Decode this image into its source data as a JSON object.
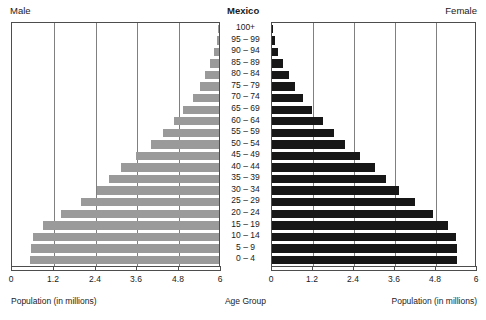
{
  "header": {
    "left_label": "Male",
    "title": "Mexico",
    "right_label": "Female"
  },
  "axis": {
    "left_title": "Population (in millions)",
    "center_title": "Age Group",
    "right_title": "Population (in millions)",
    "left_ticks": [
      "6",
      "4.8",
      "3.6",
      "2.4",
      "1.2",
      "0"
    ],
    "right_ticks": [
      "0",
      "1.2",
      "2.4",
      "3.6",
      "4.8",
      "6"
    ]
  },
  "chart_data": {
    "type": "bar",
    "subtype": "population-pyramid",
    "title": "Mexico",
    "xlabel": "Population (in millions)",
    "ylabel": "Age Group",
    "xlim": [
      0,
      6
    ],
    "xticks": [
      0,
      1.2,
      2.4,
      3.6,
      4.8,
      6
    ],
    "grid": true,
    "legend_position": "top",
    "categories": [
      "100+",
      "95 – 99",
      "90 – 94",
      "85 – 89",
      "80 – 84",
      "75 – 79",
      "70 – 74",
      "65 – 69",
      "60 – 64",
      "55 – 59",
      "50 – 54",
      "45 – 49",
      "40 – 44",
      "35 – 39",
      "30 – 34",
      "25 – 29",
      "20 – 24",
      "15 – 19",
      "10 – 14",
      "5 – 9",
      "0 – 4"
    ],
    "series": [
      {
        "name": "Male",
        "color": "#9a9a9a",
        "direction": "left",
        "values": [
          0.02,
          0.06,
          0.13,
          0.25,
          0.4,
          0.56,
          0.76,
          1.02,
          1.3,
          1.62,
          1.95,
          2.38,
          2.8,
          3.15,
          3.5,
          3.95,
          4.55,
          5.05,
          5.35,
          5.4,
          5.42
        ]
      },
      {
        "name": "Female",
        "color": "#171717",
        "direction": "right",
        "values": [
          0.03,
          0.09,
          0.19,
          0.33,
          0.5,
          0.68,
          0.9,
          1.18,
          1.48,
          1.8,
          2.15,
          2.58,
          3.0,
          3.35,
          3.72,
          4.18,
          4.72,
          5.15,
          5.38,
          5.42,
          5.4
        ]
      }
    ]
  }
}
